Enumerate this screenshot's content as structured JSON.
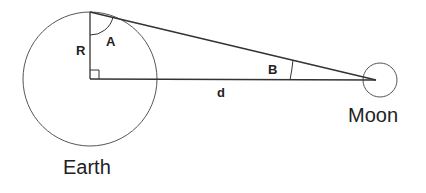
{
  "diagram": {
    "labels": {
      "earth": "Earth",
      "moon": "Moon",
      "radius": "R",
      "angle_a": "A",
      "angle_b": "B",
      "distance": "d"
    },
    "colors": {
      "line": "#333333",
      "text": "#222222",
      "background": "#ffffff"
    }
  }
}
